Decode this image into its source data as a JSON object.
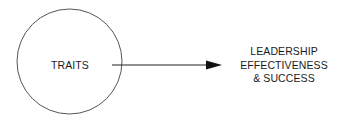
{
  "diagram": {
    "source_node": {
      "label": "TRAITS",
      "shape": "circle"
    },
    "connector": {
      "type": "arrow",
      "direction": "right"
    },
    "target_node": {
      "lines": [
        "LEADERSHIP",
        "EFFECTIVENESS",
        "& SUCCESS"
      ]
    },
    "colors": {
      "stroke": "#333333",
      "text": "#1a1a1a",
      "background": "#ffffff"
    }
  }
}
